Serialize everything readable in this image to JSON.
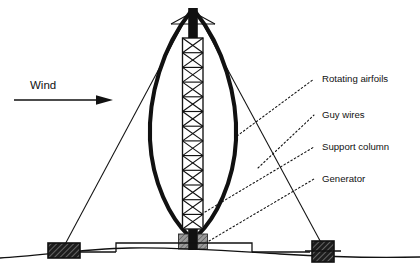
{
  "figure": {
    "background_color": "#ffffff",
    "ink_color": "#111111"
  },
  "wind": {
    "label": "Wind",
    "arrow_icon": "arrow-right-icon"
  },
  "callouts": [
    {
      "id": "rotating-airfoils",
      "label": "Rotating airfoils",
      "leader_icon": "dotted-leader-icon"
    },
    {
      "id": "guy-wires",
      "label": "Guy wires",
      "leader_icon": "dotted-leader-icon"
    },
    {
      "id": "support-column",
      "label": "Support column",
      "leader_icon": "dotted-leader-icon"
    },
    {
      "id": "generator",
      "label": "Generator",
      "leader_icon": "dotted-leader-icon"
    }
  ],
  "parts": {
    "airfoil_blade_left": "rotating-airfoil-blade-left",
    "airfoil_blade_right": "rotating-airfoil-blade-right",
    "support_column": "lattice-support-column",
    "column_segments": 13,
    "generator_box": "generator-housing",
    "guy_wire_left": "guy-wire-left",
    "guy_wire_right": "guy-wire-right",
    "anchor_left": "guy-wire-anchor-left",
    "anchor_right": "guy-wire-anchor-right",
    "foundation_pad": "concrete-foundation-pad",
    "ground_line": "ground-terrain-line"
  },
  "caption": {
    "text": ""
  }
}
